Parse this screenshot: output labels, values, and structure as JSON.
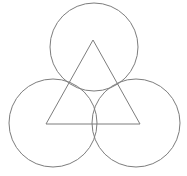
{
  "figure": {
    "title": "Three tangent circles with inscribed equilateral triangle",
    "background_color": "#ffffff",
    "stroke_color": "#7d7d7d",
    "stroke_width": 1,
    "canvas": {
      "width": 187,
      "height": 176
    },
    "shapes": [
      {
        "name": "top-circle",
        "type": "circle",
        "cx": 94,
        "cy": 47,
        "r": 44,
        "label": "Top circle"
      },
      {
        "name": "bottom-left-circle",
        "type": "circle",
        "cx": 53,
        "cy": 123,
        "r": 44,
        "label": "Bottom left circle"
      },
      {
        "name": "bottom-right-circle",
        "type": "circle",
        "cx": 136,
        "cy": 123,
        "r": 44,
        "label": "Bottom right circle"
      }
    ],
    "triangle": {
      "name": "equilateral-triangle",
      "type": "polygon",
      "points": "93,40 140,124 46,124",
      "vertices": [
        {
          "name": "apex",
          "x": 93,
          "y": 40
        },
        {
          "name": "bottom-right",
          "x": 140,
          "y": 124
        },
        {
          "name": "bottom-left",
          "x": 46,
          "y": 124
        }
      ],
      "label": "Equilateral triangle"
    }
  }
}
